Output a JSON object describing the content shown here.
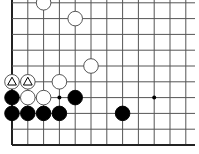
{
  "board": {
    "title": "Go problem diagram",
    "grid": {
      "origin_x": 12,
      "bottom_y": 145,
      "spacing": 15.8,
      "cols": 12,
      "rows": 10,
      "right_extent": 195,
      "top_extent": 0,
      "line_color": "#555555",
      "edge_color": "#222222"
    },
    "star_points": [
      {
        "col": 3,
        "row": 3
      },
      {
        "col": 9,
        "row": 3
      }
    ],
    "stones": [
      {
        "color": "white",
        "col": 2,
        "row": 9,
        "mark": ""
      },
      {
        "color": "white",
        "col": 4,
        "row": 8,
        "mark": ""
      },
      {
        "color": "white",
        "col": 5,
        "row": 5,
        "mark": ""
      },
      {
        "color": "white",
        "col": 0,
        "row": 4,
        "mark": "triangle"
      },
      {
        "color": "white",
        "col": 1,
        "row": 4,
        "mark": "triangle"
      },
      {
        "color": "white",
        "col": 3,
        "row": 4,
        "mark": ""
      },
      {
        "color": "white",
        "col": 1,
        "row": 3,
        "mark": ""
      },
      {
        "color": "white",
        "col": 2,
        "row": 3,
        "mark": ""
      },
      {
        "color": "black",
        "col": 0,
        "row": 3,
        "mark": ""
      },
      {
        "color": "black",
        "col": 4,
        "row": 3,
        "mark": ""
      },
      {
        "color": "black",
        "col": 0,
        "row": 2,
        "mark": ""
      },
      {
        "color": "black",
        "col": 1,
        "row": 2,
        "mark": ""
      },
      {
        "color": "black",
        "col": 2,
        "row": 2,
        "mark": ""
      },
      {
        "color": "black",
        "col": 3,
        "row": 2,
        "mark": ""
      },
      {
        "color": "black",
        "col": 7,
        "row": 2,
        "mark": ""
      }
    ]
  }
}
